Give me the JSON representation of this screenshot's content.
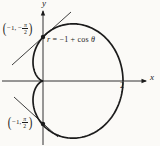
{
  "colors": {
    "ink": "#1b1b1b",
    "background": "#fbfaf7"
  },
  "equation": {
    "r": "r",
    "mid": " = −1 + ",
    "cos": "cos",
    "theta": " θ"
  },
  "upper_point": {
    "open": "(",
    "pre": "−1, −",
    "num": "π",
    "den": "2",
    "close": ")"
  },
  "lower_point": {
    "open": "(",
    "pre": "−1, ",
    "num": "π",
    "den": "2",
    "close": ")"
  },
  "axes": {
    "x_label": "x",
    "y_label": "y",
    "x_tick": "2"
  },
  "geometry": {
    "origin": {
      "x": 43,
      "y": 81
    },
    "scale": {
      "x": 40,
      "y": 44
    },
    "curve": {
      "kind": "cardioid",
      "a": 1
    },
    "x_axis": {
      "x1": 2,
      "y1": 81,
      "x2": 146,
      "y2": 81
    },
    "y_axis": {
      "x1": 43,
      "y1": 145,
      "x2": 43,
      "y2": 11
    },
    "x_arrow": {
      "tipx": 147,
      "tipy": 81,
      "dir": "right"
    },
    "y_arrow": {
      "tipx": 43,
      "tipy": 10,
      "dir": "up"
    },
    "tangent_upper": {
      "x1": 12,
      "y1": 65,
      "x2": 71,
      "y2": 12
    },
    "tangent_lower": {
      "x1": 14,
      "y1": 97,
      "x2": 58,
      "y2": 137
    },
    "dot_upper": {
      "x": 43,
      "y": 37,
      "r": 2.2
    },
    "dot_lower": {
      "x": 43,
      "y": 124,
      "r": 2.2
    }
  }
}
